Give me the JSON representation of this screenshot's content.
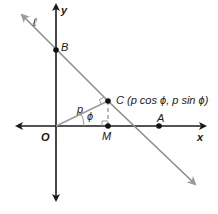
{
  "diagram": {
    "type": "coordinate-geometry",
    "axes": {
      "x_label": "x",
      "y_label": "y",
      "origin_label": "O"
    },
    "line": {
      "label": "ℓ",
      "color": "#8c8c8c"
    },
    "points": {
      "O": {
        "label": "O"
      },
      "A": {
        "label": "A"
      },
      "B": {
        "label": "B"
      },
      "C": {
        "label": "C (p cos ϕ, p sin ϕ)"
      },
      "M": {
        "label": "M"
      }
    },
    "segment_label": "p",
    "angle_label": "ϕ",
    "colors": {
      "axis": "#1a1a1a",
      "line": "#8c8c8c",
      "perpendicular": "#9a9a9a",
      "point": "#111111"
    }
  }
}
